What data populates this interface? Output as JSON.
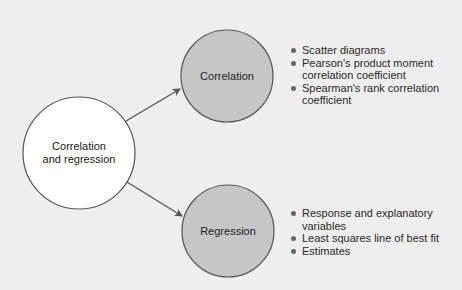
{
  "colors": {
    "background": "#eeeeee",
    "center_fill": "#ffffff",
    "branch_fill": "#c6c6c6",
    "stroke": "#555555",
    "bullet": "#666666"
  },
  "center_node": {
    "label_line1": "Correlation",
    "label_line2": "and regression"
  },
  "branches": [
    {
      "label": "Correlation",
      "items": [
        {
          "line1": "Scatter diagrams",
          "line2": ""
        },
        {
          "line1": "Pearson's product moment",
          "line2": "correlation coefficient"
        },
        {
          "line1": "Spearman's rank correlation",
          "line2": "coefficient"
        }
      ]
    },
    {
      "label": "Regression",
      "items": [
        {
          "line1": "Response and explanatory",
          "line2": "variables"
        },
        {
          "line1": "Least squares line of best fit",
          "line2": ""
        },
        {
          "line1": "Estimates",
          "line2": ""
        }
      ]
    }
  ]
}
